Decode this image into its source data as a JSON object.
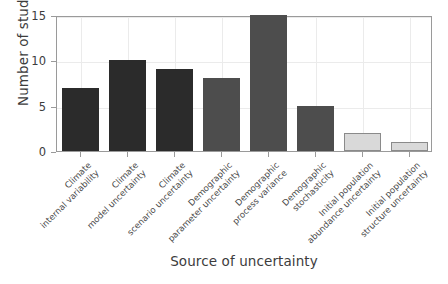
{
  "chart_data": {
    "type": "bar",
    "title": "",
    "xlabel": "Source of uncertainty",
    "ylabel": "Number of studies",
    "ylim": [
      0,
      15
    ],
    "yticks": [
      0,
      5,
      10,
      15
    ],
    "ytick_labels": [
      "0",
      "5",
      "10",
      "15"
    ],
    "grid": true,
    "legend": "none",
    "categories": [
      "Climate internal variability",
      "Climate model uncertainty",
      "Climate scenario uncertainty",
      "Demographic parameter uncertainty",
      "Demographic process variance",
      "Demographic stochasticity",
      "Initial population abundance uncertainty",
      "Initial population structure uncertainty"
    ],
    "category_lines": [
      [
        "Climate",
        "internal variability"
      ],
      [
        "Climate",
        "model uncertainty"
      ],
      [
        "Climate",
        "scenario uncertainty"
      ],
      [
        "Demographic",
        "parameter uncertainty"
      ],
      [
        "Demographic",
        "process variance"
      ],
      [
        "Demographic",
        "stochasticity"
      ],
      [
        "Initial population",
        "abundance uncertainty"
      ],
      [
        "Initial population",
        "structure uncertainty"
      ]
    ],
    "values": [
      7,
      10,
      9,
      8,
      15,
      5,
      2,
      1
    ],
    "bar_colors": [
      "#2b2b2b",
      "#2b2b2b",
      "#2b2b2b",
      "#4d4d4d",
      "#4d4d4d",
      "#4d4d4d",
      "#d9d9d9",
      "#d9d9d9"
    ],
    "bar_edge_colors": [
      "#2b2b2b",
      "#2b2b2b",
      "#2b2b2b",
      "#4d4d4d",
      "#4d4d4d",
      "#4d4d4d",
      "#8a8a8a",
      "#8a8a8a"
    ],
    "axis_color": "#9a9a9a",
    "grid_color": "#ebebeb",
    "text_color": "#3c3c3c",
    "background": "#ffffff"
  }
}
